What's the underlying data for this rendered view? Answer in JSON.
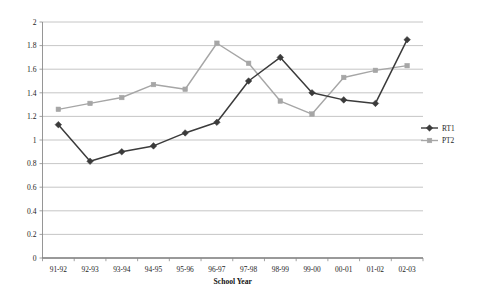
{
  "chart_data": {
    "type": "line",
    "title": "",
    "xlabel": "School Year",
    "ylabel": "",
    "ylim": [
      0,
      2
    ],
    "ytick_step": 0.2,
    "grid": "horizontal",
    "legend_position": "right",
    "categories": [
      "91-92",
      "92-93",
      "93-94",
      "94-95",
      "95-96",
      "96-97",
      "97-98",
      "98-99",
      "99-00",
      "00-01",
      "01-02",
      "02-03"
    ],
    "yticks": [
      "0",
      "0.2",
      "0.4",
      "0.6",
      "0.8",
      "1",
      "1.2",
      "1.4",
      "1.6",
      "1.8",
      "2"
    ],
    "series": [
      {
        "name": "RT1",
        "color": "#3b3b3b",
        "marker": "diamond",
        "values": [
          1.13,
          0.82,
          0.9,
          0.95,
          1.06,
          1.15,
          1.5,
          1.7,
          1.4,
          1.34,
          1.31,
          1.85
        ]
      },
      {
        "name": "PT2",
        "color": "#a6a6a6",
        "marker": "square",
        "values": [
          1.26,
          1.31,
          1.36,
          1.47,
          1.43,
          1.82,
          1.65,
          1.33,
          1.22,
          1.53,
          1.59,
          1.63
        ]
      }
    ]
  },
  "legend": {
    "items": [
      {
        "label": "RT1"
      },
      {
        "label": "PT2"
      }
    ]
  },
  "axis": {
    "x_title": "School Year"
  }
}
